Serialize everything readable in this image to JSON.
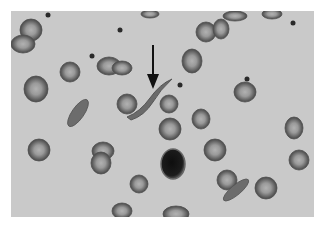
{
  "image": {
    "subject": "Blood smear micrograph showing red blood cells with a sickle-shaped cell indicated by an arrow",
    "background_color": "#c9c9c9",
    "cell_color": "#6e6e6e",
    "cell_center_color": "#a8a8a8",
    "nucleus_color": "#1a1a1a",
    "arrow_color": "#111111"
  },
  "annotation": {
    "type": "arrow",
    "points_to": "sickle cell",
    "x": 153,
    "y_start": 45,
    "y_end": 88
  },
  "cells": [
    {
      "cx": 31,
      "cy": 30,
      "rx": 11,
      "ry": 11
    },
    {
      "cx": 23,
      "cy": 44,
      "rx": 12,
      "ry": 9
    },
    {
      "cx": 70,
      "cy": 72,
      "rx": 10,
      "ry": 10
    },
    {
      "cx": 36,
      "cy": 89,
      "rx": 12,
      "ry": 13
    },
    {
      "cx": 109,
      "cy": 66,
      "rx": 12,
      "ry": 9
    },
    {
      "cx": 122,
      "cy": 68,
      "rx": 10,
      "ry": 7
    },
    {
      "cx": 206,
      "cy": 32,
      "rx": 10,
      "ry": 10
    },
    {
      "cx": 221,
      "cy": 29,
      "rx": 8,
      "ry": 10
    },
    {
      "cx": 192,
      "cy": 61,
      "rx": 10,
      "ry": 12
    },
    {
      "cx": 245,
      "cy": 92,
      "rx": 11,
      "ry": 10
    },
    {
      "cx": 127,
      "cy": 104,
      "rx": 10,
      "ry": 10
    },
    {
      "cx": 169,
      "cy": 104,
      "rx": 9,
      "ry": 9
    },
    {
      "cx": 170,
      "cy": 129,
      "rx": 11,
      "ry": 11
    },
    {
      "cx": 201,
      "cy": 119,
      "rx": 9,
      "ry": 10
    },
    {
      "cx": 39,
      "cy": 150,
      "rx": 11,
      "ry": 11
    },
    {
      "cx": 103,
      "cy": 151,
      "rx": 11,
      "ry": 9
    },
    {
      "cx": 101,
      "cy": 163,
      "rx": 10,
      "ry": 11
    },
    {
      "cx": 139,
      "cy": 184,
      "rx": 9,
      "ry": 9
    },
    {
      "cx": 215,
      "cy": 150,
      "rx": 11,
      "ry": 11
    },
    {
      "cx": 227,
      "cy": 180,
      "rx": 10,
      "ry": 10
    },
    {
      "cx": 266,
      "cy": 188,
      "rx": 11,
      "ry": 11
    },
    {
      "cx": 294,
      "cy": 128,
      "rx": 9,
      "ry": 11
    },
    {
      "cx": 299,
      "cy": 160,
      "rx": 10,
      "ry": 10
    },
    {
      "cx": 122,
      "cy": 211,
      "rx": 10,
      "ry": 8
    },
    {
      "cx": 176,
      "cy": 214,
      "rx": 13,
      "ry": 8
    },
    {
      "cx": 235,
      "cy": 16,
      "rx": 12,
      "ry": 5
    },
    {
      "cx": 272,
      "cy": 14,
      "rx": 10,
      "ry": 5
    },
    {
      "cx": 150,
      "cy": 14,
      "rx": 9,
      "ry": 4
    }
  ],
  "elongated_cells": [
    {
      "cx": 78,
      "cy": 113,
      "rx": 16,
      "ry": 6,
      "rotate": -55
    },
    {
      "cx": 236,
      "cy": 190,
      "rx": 16,
      "ry": 5,
      "rotate": -40
    }
  ],
  "nucleated_cell": {
    "cx": 173,
    "cy": 164,
    "rx": 12,
    "ry": 15
  },
  "platelets": [
    {
      "cx": 48,
      "cy": 15
    },
    {
      "cx": 120,
      "cy": 30
    },
    {
      "cx": 92,
      "cy": 56
    },
    {
      "cx": 293,
      "cy": 23
    },
    {
      "cx": 247,
      "cy": 79
    },
    {
      "cx": 180,
      "cy": 85
    }
  ]
}
